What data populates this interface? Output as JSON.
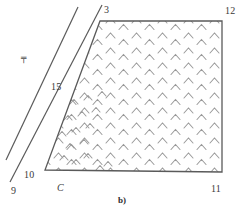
{
  "figure": {
    "caption": "b)",
    "background_color": "#ffffff",
    "line_color": "#5a5a5a",
    "hatch_color": "#9a9a9a",
    "label_color": "#3a3a3a",
    "annotation_glyph": "╤",
    "labels": [
      {
        "id": "label-3",
        "text": "3",
        "x": 104,
        "y": 5,
        "italic": false
      },
      {
        "id": "label-12",
        "text": "12",
        "x": 225,
        "y": 6,
        "italic": false
      },
      {
        "id": "label-15",
        "text": "15",
        "x": 51,
        "y": 82,
        "italic": false
      },
      {
        "id": "label-10",
        "text": "10",
        "x": 24,
        "y": 170,
        "italic": false
      },
      {
        "id": "label-9",
        "text": "9",
        "x": 11,
        "y": 186,
        "italic": false
      },
      {
        "id": "label-C",
        "text": "C",
        "x": 57,
        "y": 183,
        "italic": true
      },
      {
        "id": "label-11",
        "text": "11",
        "x": 211,
        "y": 184,
        "italic": false
      }
    ],
    "polygon": {
      "name": "hatched-quadrilateral",
      "points": "100,21 222,21 222,172 45,170",
      "vertex_labels": [
        "3",
        "12",
        "11",
        "C"
      ]
    },
    "diagonal_lines": [
      {
        "id": "diagonal-line-outer",
        "x1": 6,
        "y1": 160,
        "x2": 78,
        "y2": 7
      },
      {
        "id": "diagonal-line-middle",
        "x1": 10,
        "y1": 182,
        "x2": 102,
        "y2": 5
      },
      {
        "id": "diagonal-line-inner",
        "x1": 45,
        "y1": 170,
        "x2": 100,
        "y2": 21
      }
    ],
    "hatch": {
      "type": "chevron-caret",
      "description": "staggered grid of small caret marks filling the quadrilateral",
      "rows": 14,
      "cols": 9
    },
    "caption_position": {
      "x": 118,
      "y": 195
    }
  }
}
